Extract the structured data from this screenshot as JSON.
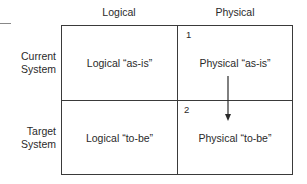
{
  "diagram": {
    "columns": [
      {
        "label": "Logical"
      },
      {
        "label": "Physical"
      }
    ],
    "rows": [
      {
        "label_line1": "Current",
        "label_line2": "System"
      },
      {
        "label_line1": "Target",
        "label_line2": "System"
      }
    ],
    "cells": {
      "logical_current": "Logical “as-is”",
      "physical_current": "Physical “as-is”",
      "logical_target": "Logical “to-be”",
      "physical_target": "Physical “to-be”"
    },
    "markers": {
      "physical_current": "1",
      "physical_target": "2"
    },
    "arrow": {
      "from": "physical_current",
      "to": "physical_target"
    }
  }
}
